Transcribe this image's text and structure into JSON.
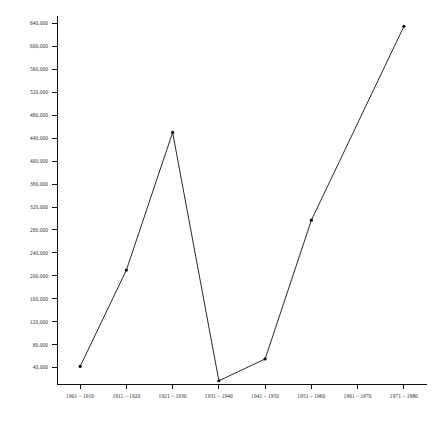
{
  "chart_data": {
    "type": "line",
    "title": "",
    "subtitle": "",
    "xlabel": "",
    "ylabel": "",
    "categories": [
      "1901 – 1910",
      "1911 – 1920",
      "1921 – 1930",
      "1931 – 1940",
      "1941 – 1950",
      "1951 – 1960",
      "1961 – 1970",
      "1971 – 1980"
    ],
    "values": [
      42000,
      210000,
      450000,
      17000,
      55000,
      297000,
      null,
      635000
    ],
    "series": [
      {
        "name": "",
        "values": [
          42000,
          210000,
          450000,
          17000,
          55000,
          297000,
          null,
          635000
        ]
      }
    ],
    "markers": [
      true,
      true,
      true,
      true,
      true,
      true,
      false,
      true
    ],
    "ylim": [
      0,
      660000
    ],
    "xlim": [
      0,
      8
    ],
    "y_tick_values": [
      40000,
      80000,
      120000,
      160000,
      200000,
      240000,
      280000,
      320000,
      360000,
      400000,
      440000,
      480000,
      520000,
      560000,
      600000,
      640000
    ],
    "y_tick_labels": [
      "40,000",
      "80,000",
      "120,000",
      "160,000",
      "200,000",
      "240,000",
      "280,000",
      "320,000",
      "360,000",
      "400,000",
      "440,000",
      "480,000",
      "520,000",
      "560,000",
      "600,000",
      "640,000"
    ],
    "grid": false,
    "legend": null,
    "legend_position": "none",
    "line_color": "#111111",
    "marker_color": "#0d0d0d",
    "background_color": "#ffffff",
    "axis_color": "#111111",
    "tick_label_color": "#2b2b2b"
  }
}
